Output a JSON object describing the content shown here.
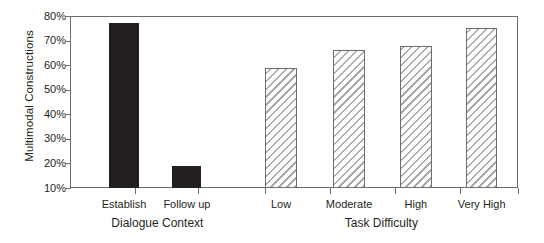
{
  "chart_data": {
    "type": "bar",
    "title": "",
    "xlabel": "",
    "ylabel": "Multimodal Constructions",
    "ylim": [
      10,
      80
    ],
    "ytick_labels": [
      "80%",
      "70%",
      "60%",
      "50%",
      "40%",
      "30%",
      "20%",
      "10%"
    ],
    "ytick_values": [
      80,
      70,
      60,
      50,
      40,
      30,
      20,
      10
    ],
    "grid": false,
    "legend": "none",
    "categories": [
      "Establish",
      "Follow up",
      "Low",
      "Moderate",
      "High",
      "Very High"
    ],
    "values": [
      77,
      19,
      59,
      66,
      68,
      75
    ],
    "groups": [
      {
        "title": "Dialogue Context",
        "fill": "solid-black",
        "categories": [
          "Establish",
          "Follow up"
        ],
        "values": [
          77,
          19
        ]
      },
      {
        "title": "Task Difficulty",
        "fill": "diagonal-hatch",
        "categories": [
          "Low",
          "Moderate",
          "High",
          "Very High"
        ],
        "values": [
          59,
          66,
          68,
          75
        ]
      }
    ]
  },
  "axis": {
    "y_title": "Multimodal Constructions",
    "y_ticks": [
      {
        "label": "80%",
        "value": 80
      },
      {
        "label": "70%",
        "value": 70
      },
      {
        "label": "60%",
        "value": 60
      },
      {
        "label": "50%",
        "value": 50
      },
      {
        "label": "40%",
        "value": 40
      },
      {
        "label": "30%",
        "value": 30
      },
      {
        "label": "20%",
        "value": 20
      },
      {
        "label": "10%",
        "value": 10
      }
    ]
  },
  "bars": [
    {
      "label": "Establish",
      "value": 77,
      "style": "solid",
      "center_pct": 12.05,
      "width_pct": 6.5
    },
    {
      "label": "Follow up",
      "value": 19,
      "style": "solid",
      "center_pct": 26.1,
      "width_pct": 6.5
    },
    {
      "label": "Low",
      "value": 59,
      "style": "hatched",
      "center_pct": 47.1,
      "width_pct": 7.0
    },
    {
      "label": "Moderate",
      "value": 66,
      "style": "hatched",
      "center_pct": 62.3,
      "width_pct": 7.0
    },
    {
      "label": "High",
      "value": 68,
      "style": "hatched",
      "center_pct": 77.2,
      "width_pct": 7.0
    },
    {
      "label": "Very High",
      "value": 75,
      "style": "hatched",
      "center_pct": 91.9,
      "width_pct": 7.0
    }
  ],
  "x_tick_positions_pct": [
    14.5,
    28.6,
    43.5,
    58.0,
    72.5,
    87.0,
    100
  ],
  "group_titles": [
    {
      "label": "Dialogue Context",
      "center_pct": 19.5
    },
    {
      "label": "Task Difficulty",
      "center_pct": 69.5
    }
  ]
}
